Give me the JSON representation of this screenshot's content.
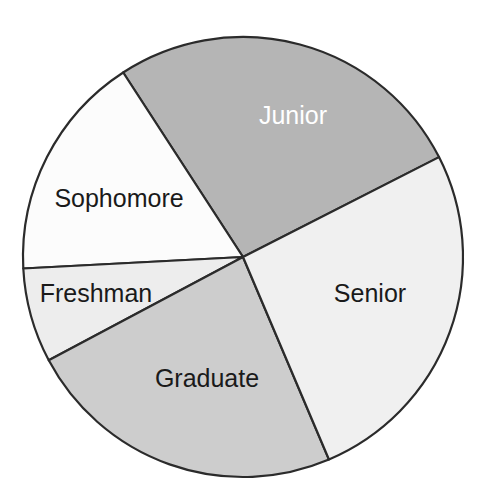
{
  "chart_data": {
    "type": "pie",
    "title": "",
    "subtitle": "",
    "xlabel": "",
    "ylabel": "",
    "legend_position": "none",
    "grid": false,
    "labels_inside_slices": true,
    "categories": [
      "Junior",
      "Senior",
      "Graduate",
      "Freshman",
      "Sophomore"
    ],
    "values": [
      26.7,
      26.1,
      23.6,
      6.9,
      16.7
    ],
    "units": "percent",
    "slices": [
      {
        "label": "Junior",
        "value": 26.7,
        "angle_degrees": 96,
        "start_angle_deg": 27,
        "end_angle_deg": 123,
        "fill": "#b5b5b5",
        "text_color": "#ffffff",
        "label_x": 293,
        "label_y": 117
      },
      {
        "label": "Sophomore",
        "value": 16.7,
        "angle_degrees": 60,
        "start_angle_deg": 123,
        "end_angle_deg": 183,
        "fill": "#fcfcfc",
        "text_color": "#1a1a1a",
        "label_x": 119,
        "label_y": 200
      },
      {
        "label": "Freshman",
        "value": 6.9,
        "angle_degrees": 25,
        "start_angle_deg": 183,
        "end_angle_deg": 208,
        "fill": "#ededed",
        "text_color": "#1a1a1a",
        "label_x": 96,
        "label_y": 295
      },
      {
        "label": "Graduate",
        "value": 23.6,
        "angle_degrees": 85,
        "start_angle_deg": 208,
        "end_angle_deg": 293,
        "fill": "#cdcdcd",
        "text_color": "#1a1a1a",
        "label_x": 207,
        "label_y": 380
      },
      {
        "label": "Senior",
        "value": 26.1,
        "angle_degrees": 94,
        "start_angle_deg": 293,
        "end_angle_deg": 387,
        "fill": "#f0f0f0",
        "text_color": "#1a1a1a",
        "label_x": 370,
        "label_y": 295
      }
    ],
    "geometry": {
      "center_x": 243,
      "center_y": 257,
      "radius": 220
    },
    "colors": {
      "outline": "#2b2b2b",
      "background": "#ffffff"
    }
  }
}
